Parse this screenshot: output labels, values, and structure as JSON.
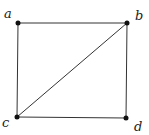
{
  "diagram": {
    "type": "graph",
    "nodes": [
      {
        "id": "a",
        "label": "a",
        "x": 18,
        "y": 23,
        "lx": 4,
        "ly": 18
      },
      {
        "id": "b",
        "label": "b",
        "x": 127,
        "y": 23,
        "lx": 135,
        "ly": 20
      },
      {
        "id": "c",
        "label": "c",
        "x": 17,
        "y": 117,
        "lx": 2,
        "ly": 127
      },
      {
        "id": "d",
        "label": "d",
        "x": 126,
        "y": 118,
        "lx": 134,
        "ly": 131
      }
    ],
    "edges": [
      [
        "a",
        "b"
      ],
      [
        "a",
        "c"
      ],
      [
        "b",
        "d"
      ],
      [
        "c",
        "d"
      ],
      [
        "c",
        "b"
      ]
    ],
    "colors": {
      "edge": "#333333",
      "node": "#111111",
      "label": "#222222"
    }
  }
}
